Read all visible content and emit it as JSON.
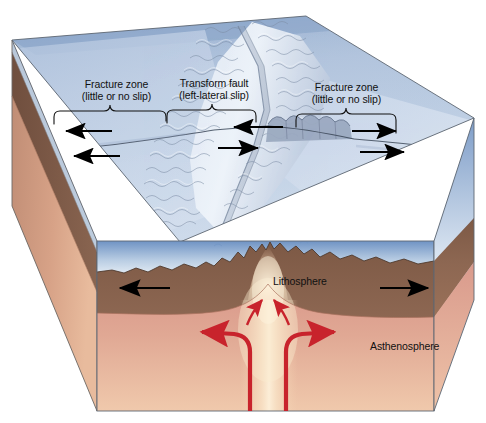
{
  "figure": {
    "kind": "geology-block-diagram",
    "annotations": {
      "fracture_zone_left": {
        "line1": "Fracture zone",
        "line2": "(little or no slip)"
      },
      "transform_fault": {
        "line1": "Transform fault",
        "line2": "(left-lateral slip)"
      },
      "fracture_zone_right": {
        "line1": "Fracture zone",
        "line2": "(little or no slip)"
      },
      "lithosphere": "Lithosphere",
      "asthenosphere": "Asthenosphere"
    },
    "motion_arrows": {
      "surface_black_count": 6,
      "surface_directions": [
        "left",
        "left",
        "left",
        "right",
        "right",
        "right"
      ],
      "cross_section_black": [
        "left",
        "right"
      ],
      "magma_red": [
        "up-left",
        "up-right",
        "up-then-left",
        "up-then-right"
      ]
    },
    "colors": {
      "water_deep": "#9fb5d4",
      "water_shallow": "#cfdcec",
      "water_front_top": "#6f93c4",
      "water_front_bottom": "#e4ecf5",
      "seafloor_plain": "#c3d2e6",
      "ridge_highlight": "#eef3f9",
      "ridge_shadow": "#8d9cb4",
      "lithosphere": "#8a6550",
      "lithosphere_dark": "#6f4f3e",
      "asthenosphere": "#dda091",
      "asthenosphere_light": "#f0cdb4",
      "magma_glow": "#f7e3c6",
      "side_face": "#cf9c82",
      "arrow_black": "#000000",
      "arrow_red": "#c8232c",
      "outline": "#55606e"
    }
  }
}
